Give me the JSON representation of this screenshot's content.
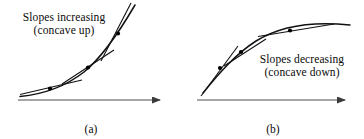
{
  "figure": {
    "background_color": "#ffffff",
    "ink_color": "#111111",
    "axis_color": "#3a3a3a",
    "panels": [
      {
        "id": "a",
        "caption": "(a)",
        "annotation": {
          "line1": "Slopes increasing",
          "line2": "(concave up)"
        },
        "axis": {
          "x1": 18,
          "y1": 100,
          "x2": 165,
          "y2": 100,
          "arrow": "right"
        },
        "curve": {
          "description": "concave-up increasing curve",
          "path": "M 20,96 C 46,94 66,86 84,72 C 100,59 118,34 135,5",
          "tangent_points": [
            {
              "x": 50,
              "y": 88
            },
            {
              "x": 88,
              "y": 67
            },
            {
              "x": 118,
              "y": 33
            }
          ],
          "tangent_lines": [
            {
              "x1": 20,
              "y1": 94,
              "x2": 82,
              "y2": 80
            },
            {
              "x1": 62,
              "y1": 84,
              "x2": 114,
              "y2": 50
            },
            {
              "x1": 101,
              "y1": 60,
              "x2": 131,
              "y2": 3
            }
          ]
        }
      },
      {
        "id": "b",
        "caption": "(b)",
        "annotation": {
          "line1": "Slopes decreasing",
          "line2": "(concave down)"
        },
        "axis": {
          "x1": 15,
          "y1": 100,
          "x2": 168,
          "y2": 100,
          "arrow": "right"
        },
        "curve": {
          "description": "concave-down increasing curve",
          "path": "M 21,93 C 38,72 54,54 74,41 C 98,26 130,21 168,25",
          "tangent_points": [
            {
              "x": 38,
              "y": 68
            },
            {
              "x": 59,
              "y": 52
            },
            {
              "x": 108,
              "y": 31
            }
          ],
          "tangent_lines": [
            {
              "x1": 19,
              "y1": 96,
              "x2": 56,
              "y2": 46
            },
            {
              "x1": 42,
              "y1": 66,
              "x2": 84,
              "y2": 39
            },
            {
              "x1": 76,
              "y1": 36,
              "x2": 152,
              "y2": 24
            }
          ]
        }
      }
    ]
  }
}
